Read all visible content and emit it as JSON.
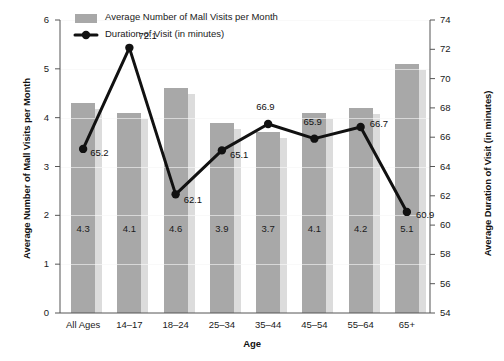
{
  "chart_data": {
    "type": "bar",
    "title": "",
    "xlabel": "Age",
    "categories": [
      "All Ages",
      "14–17",
      "18–24",
      "25–34",
      "35–44",
      "45–54",
      "55–64",
      "65+"
    ],
    "grid": true,
    "legend_position": "top-left",
    "series": [
      {
        "name": "Average Number of Mall Visits per Month",
        "type": "bar",
        "axis": "left",
        "color": "#a8a8a8",
        "shadow_color": "#dcdcdc",
        "values": [
          4.3,
          4.1,
          4.6,
          3.9,
          3.7,
          4.1,
          4.2,
          5.1
        ],
        "labels": [
          "4.3",
          "4.1",
          "4.6",
          "3.9",
          "3.7",
          "4.1",
          "4.2",
          "5.1"
        ]
      },
      {
        "name": "Duration of Visit (in minutes)",
        "type": "line",
        "axis": "right",
        "color": "#111111",
        "values": [
          65.2,
          72.1,
          62.1,
          65.1,
          66.9,
          65.9,
          66.7,
          60.9
        ],
        "labels": [
          "65.2",
          "72.1",
          "62.1",
          "65.1",
          "66.9",
          "65.9",
          "66.7",
          "60.9"
        ]
      }
    ],
    "axes": {
      "left": {
        "title": "Average Number of Mall Visits per Month",
        "ylim": [
          0,
          6
        ],
        "ticks": [
          0,
          1,
          2,
          3,
          4,
          5,
          6
        ],
        "tick_labels": [
          "0",
          "1",
          "2",
          "3",
          "4",
          "5",
          "6"
        ]
      },
      "right": {
        "title": "Average Duration of Visit (in minutes)",
        "ylim": [
          54,
          74
        ],
        "ticks": [
          54,
          56,
          58,
          60,
          62,
          64,
          66,
          68,
          70,
          72,
          74
        ],
        "tick_labels": [
          "54",
          "56",
          "58",
          "60",
          "62",
          "64",
          "66",
          "68",
          "70",
          "72",
          "74"
        ]
      },
      "x": {
        "title": "Age"
      }
    },
    "legend": [
      {
        "label": "Average Number of Mall Visits per Month",
        "marker": "swatch"
      },
      {
        "label": "Duration of Visit (in minutes)",
        "marker": "line-dot"
      }
    ]
  }
}
